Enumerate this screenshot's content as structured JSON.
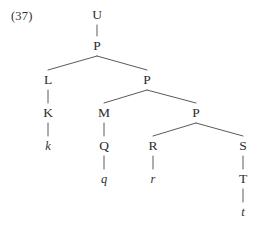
{
  "figure": {
    "example_number": "(37)",
    "width": 263,
    "height": 227,
    "ink_color": "#2e2c2b",
    "line_color": "#4a4745",
    "background": "#ffffff"
  },
  "tree": {
    "nodes": [
      {
        "id": "U",
        "label": "U",
        "x": 97,
        "y": 15,
        "italic": false
      },
      {
        "id": "P1",
        "label": "P",
        "x": 97,
        "y": 46,
        "italic": false
      },
      {
        "id": "L",
        "label": "L",
        "x": 48,
        "y": 80,
        "italic": false
      },
      {
        "id": "P2",
        "label": "P",
        "x": 147,
        "y": 80,
        "italic": false
      },
      {
        "id": "K",
        "label": "K",
        "x": 48,
        "y": 113,
        "italic": false
      },
      {
        "id": "M",
        "label": "M",
        "x": 104,
        "y": 113,
        "italic": false
      },
      {
        "id": "P3",
        "label": "P",
        "x": 196,
        "y": 113,
        "italic": false
      },
      {
        "id": "k",
        "label": "k",
        "x": 48,
        "y": 146,
        "italic": true
      },
      {
        "id": "Q",
        "label": "Q",
        "x": 104,
        "y": 146,
        "italic": false
      },
      {
        "id": "R",
        "label": "R",
        "x": 153,
        "y": 146,
        "italic": false
      },
      {
        "id": "S",
        "label": "S",
        "x": 243,
        "y": 146,
        "italic": false
      },
      {
        "id": "q",
        "label": "q",
        "x": 104,
        "y": 179,
        "italic": true
      },
      {
        "id": "r",
        "label": "r",
        "x": 153,
        "y": 179,
        "italic": true
      },
      {
        "id": "T",
        "label": "T",
        "x": 243,
        "y": 179,
        "italic": false
      },
      {
        "id": "t",
        "label": "t",
        "x": 243,
        "y": 212,
        "italic": true
      }
    ],
    "edges": [
      {
        "from": "U",
        "to": "P1"
      },
      {
        "from": "P1",
        "to": "L"
      },
      {
        "from": "P1",
        "to": "P2"
      },
      {
        "from": "L",
        "to": "K"
      },
      {
        "from": "K",
        "to": "k"
      },
      {
        "from": "P2",
        "to": "M"
      },
      {
        "from": "P2",
        "to": "P3"
      },
      {
        "from": "M",
        "to": "Q"
      },
      {
        "from": "Q",
        "to": "q"
      },
      {
        "from": "P3",
        "to": "R"
      },
      {
        "from": "P3",
        "to": "S"
      },
      {
        "from": "R",
        "to": "r"
      },
      {
        "from": "S",
        "to": "T"
      },
      {
        "from": "T",
        "to": "t"
      }
    ]
  }
}
